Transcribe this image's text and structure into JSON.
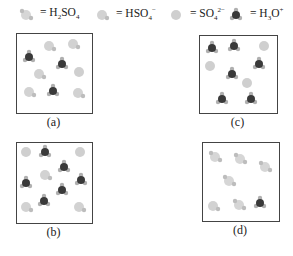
{
  "legend": [
    {
      "species": "H2SO4",
      "label_html": "= H₂SO₄",
      "icon": "h2so4-molecule-icon"
    },
    {
      "species": "HSO4-",
      "label_html": "= HSO₄⁻",
      "icon": "hso4-ion-icon"
    },
    {
      "species": "SO4 2-",
      "label_html": "= SO₄²⁻",
      "icon": "so4-ion-icon"
    },
    {
      "species": "H3O+",
      "label_html": "= H₃O⁺",
      "icon": "h3o-ion-icon"
    }
  ],
  "panels": [
    {
      "id": "a",
      "label": "(a)",
      "box": {
        "x": 16,
        "y": 33,
        "w": 75,
        "h": 79
      },
      "particles": [
        {
          "type": "HSO4",
          "x": 32,
          "y": 12
        },
        {
          "type": "HSO4",
          "x": 56,
          "y": 10
        },
        {
          "type": "H3O",
          "x": 12,
          "y": 23
        },
        {
          "type": "H3O",
          "x": 45,
          "y": 30
        },
        {
          "type": "HSO4",
          "x": 22,
          "y": 40
        },
        {
          "type": "SO4",
          "x": 62,
          "y": 38
        },
        {
          "type": "HSO4",
          "x": 12,
          "y": 58
        },
        {
          "type": "H3O",
          "x": 36,
          "y": 57
        },
        {
          "type": "HSO4",
          "x": 61,
          "y": 59
        }
      ]
    },
    {
      "id": "c",
      "label": "(c)",
      "box": {
        "x": 199,
        "y": 35,
        "w": 77,
        "h": 77
      },
      "particles": [
        {
          "type": "H3O",
          "x": 12,
          "y": 12
        },
        {
          "type": "H3O",
          "x": 34,
          "y": 10
        },
        {
          "type": "SO4",
          "x": 64,
          "y": 10
        },
        {
          "type": "SO4",
          "x": 10,
          "y": 30
        },
        {
          "type": "H3O",
          "x": 59,
          "y": 28
        },
        {
          "type": "H3O",
          "x": 32,
          "y": 38
        },
        {
          "type": "SO4",
          "x": 47,
          "y": 47
        },
        {
          "type": "H3O",
          "x": 22,
          "y": 63
        },
        {
          "type": "H3O",
          "x": 51,
          "y": 63
        }
      ]
    },
    {
      "id": "b",
      "label": "(b)",
      "box": {
        "x": 16,
        "y": 142,
        "w": 75,
        "h": 80
      },
      "particles": [
        {
          "type": "SO4",
          "x": 9,
          "y": 9
        },
        {
          "type": "H3O",
          "x": 28,
          "y": 9
        },
        {
          "type": "SO4",
          "x": 63,
          "y": 9
        },
        {
          "type": "H3O",
          "x": 47,
          "y": 24
        },
        {
          "type": "HSO4",
          "x": 28,
          "y": 32
        },
        {
          "type": "H3O",
          "x": 9,
          "y": 40
        },
        {
          "type": "H3O",
          "x": 64,
          "y": 37
        },
        {
          "type": "H3O",
          "x": 45,
          "y": 47
        },
        {
          "type": "HSO4",
          "x": 9,
          "y": 64
        },
        {
          "type": "H3O",
          "x": 27,
          "y": 58
        },
        {
          "type": "HSO4",
          "x": 62,
          "y": 64
        }
      ]
    },
    {
      "id": "d",
      "label": "(d)",
      "box": {
        "x": 202,
        "y": 142,
        "w": 76,
        "h": 78
      },
      "particles": [
        {
          "type": "H2SO4",
          "x": 12,
          "y": 14
        },
        {
          "type": "H2SO4",
          "x": 37,
          "y": 16
        },
        {
          "type": "H2SO4",
          "x": 62,
          "y": 24
        },
        {
          "type": "H2SO4",
          "x": 26,
          "y": 38
        },
        {
          "type": "HSO4",
          "x": 10,
          "y": 63
        },
        {
          "type": "H2SO4",
          "x": 36,
          "y": 62
        },
        {
          "type": "H3O",
          "x": 57,
          "y": 60
        }
      ]
    }
  ]
}
